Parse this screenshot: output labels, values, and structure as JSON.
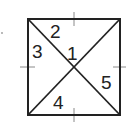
{
  "diagram": {
    "type": "square-with-diagonals",
    "stroke_color": "#222222",
    "tick_color": "#777777",
    "square": {
      "x1": 28,
      "y1": 19,
      "x2": 120,
      "y2": 115
    },
    "center": {
      "x": 74,
      "y": 67
    },
    "angle_labels": [
      {
        "id": "1",
        "text": "1",
        "x": 67,
        "y": 60
      },
      {
        "id": "2",
        "text": "2",
        "x": 50,
        "y": 38
      },
      {
        "id": "3",
        "text": "3",
        "x": 32,
        "y": 58
      },
      {
        "id": "4",
        "text": "4",
        "x": 53,
        "y": 109
      },
      {
        "id": "5",
        "text": "5",
        "x": 101,
        "y": 89
      }
    ],
    "ticks": {
      "top": {
        "x": 74,
        "y": 19
      },
      "bottom": {
        "x": 74,
        "y": 115
      },
      "left": {
        "x": 28,
        "y": 67
      },
      "right": {
        "x": 120,
        "y": 67
      }
    },
    "marker_dot": {
      "x": 2,
      "y": 33
    }
  }
}
